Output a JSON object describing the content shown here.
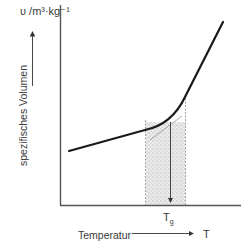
{
  "diagram": {
    "title": "",
    "y_axis": {
      "unit_label": "υ /m³·kg⁻¹",
      "name": "spezifisches Volumen"
    },
    "x_axis": {
      "name": "Temperatur",
      "symbol": "T"
    },
    "annotations": {
      "glass_transition_label": "T",
      "glass_transition_subscript": "g"
    },
    "colors": {
      "curve": "#1a1a1a",
      "axis": "#555555",
      "shading": "#bdbdbd",
      "text": "#3a3a3a"
    }
  }
}
